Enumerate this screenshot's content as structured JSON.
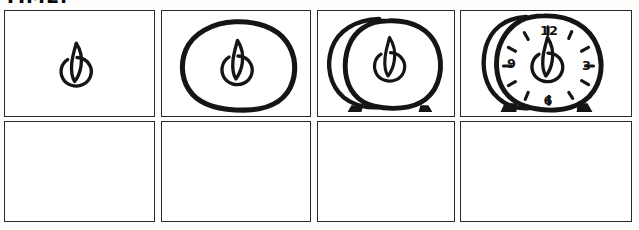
{
  "page": {
    "title_partial": "TIME.",
    "media": "hand-drawn storyboard",
    "background_color": "#fdfdfc",
    "ink_color": "#151515",
    "panel_border_color": "#2a2a2a"
  },
  "grid": {
    "rows": 2,
    "columns": 4,
    "total_panels": 8
  },
  "panels": [
    {
      "index": 1,
      "row": 1,
      "column": 1,
      "name": "panel-1-flame-circle",
      "content_label": "small circle with flame shape inside",
      "empty": false
    },
    {
      "index": 2,
      "row": 1,
      "column": 2,
      "name": "panel-2-blob-around-flame",
      "content_label": "large irregular blob drawn around the flame circle",
      "empty": false
    },
    {
      "index": 3,
      "row": 1,
      "column": 3,
      "name": "panel-3-double-blob-with-feet",
      "content_label": "two overlapping blobs with two small feet at the base",
      "empty": false
    },
    {
      "index": 4,
      "row": 1,
      "column": 4,
      "name": "panel-4-alarm-clock",
      "content_label": "alarm clock face with numerals, tick marks and feet",
      "empty": false
    },
    {
      "index": 5,
      "row": 2,
      "column": 1,
      "name": "panel-5-empty",
      "content_label": "",
      "empty": true
    },
    {
      "index": 6,
      "row": 2,
      "column": 2,
      "name": "panel-6-empty",
      "content_label": "",
      "empty": true
    },
    {
      "index": 7,
      "row": 2,
      "column": 3,
      "name": "panel-7-empty",
      "content_label": "",
      "empty": true
    },
    {
      "index": 8,
      "row": 2,
      "column": 4,
      "name": "panel-8-empty",
      "content_label": "",
      "empty": true
    }
  ],
  "clock": {
    "numerals": [
      "12",
      "3",
      "6",
      "9"
    ],
    "numeral_12": "12",
    "numeral_3": "3",
    "numeral_6": "6",
    "numeral_9": "9",
    "tick_count": 12,
    "has_feet": true
  }
}
